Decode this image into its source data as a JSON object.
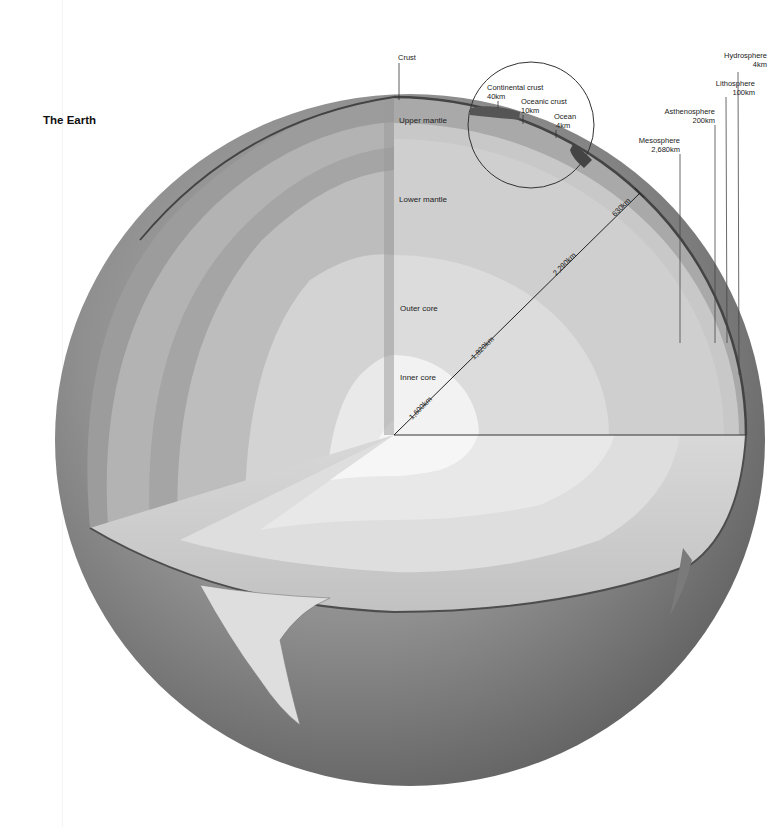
{
  "title": "The Earth",
  "layers": {
    "crust": "Crust",
    "upper_mantle": "Upper mantle",
    "lower_mantle": "Lower mantle",
    "outer_core": "Outer core",
    "inner_core": "Inner core"
  },
  "inset": {
    "continental_crust": {
      "label": "Continental crust",
      "value": "40km"
    },
    "oceanic_crust": {
      "label": "Oceanic crust",
      "value": "10km"
    },
    "ocean": {
      "label": "Ocean",
      "value": "4km"
    }
  },
  "spheres": {
    "hydrosphere": {
      "label": "Hydrosphere",
      "value": "4km"
    },
    "lithosphere": {
      "label": "Lithosphere",
      "value": "100km"
    },
    "asthenosphere": {
      "label": "Asthenosphere",
      "value": "200km"
    },
    "mesosphere": {
      "label": "Mesosphere",
      "value": "2,680km"
    }
  },
  "radii": {
    "inner_core": "1,600km",
    "outer_core": "1,820km",
    "lower_mantle": "2,290km",
    "upper_mantle": "630km"
  },
  "colors": {
    "sphere_dark": "#6e6e6e",
    "sphere_mid": "#9a9a9a",
    "upper_mantle": "#a9a9a9",
    "lower_mantle": "#c4c4c4",
    "outer_core": "#dcdcdc",
    "inner_core": "#f2f2f2",
    "crust": "#555555"
  }
}
